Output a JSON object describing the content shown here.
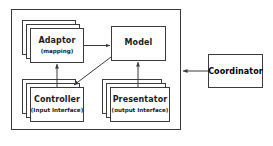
{
  "diagram": {
    "background_color": "#ffffff",
    "line_color": "#3b3b3b",
    "text_color": "#1a1a1a"
  },
  "container": {
    "name": "system-container",
    "label": ""
  },
  "nodes": [
    {
      "id": "adaptor",
      "title": "Adaptor",
      "subtitle": "(mapping)",
      "stacked": true,
      "stack_count": 3
    },
    {
      "id": "model",
      "title": "Model",
      "subtitle": "",
      "stacked": false,
      "stack_count": 1
    },
    {
      "id": "controller",
      "title": "Controller",
      "subtitle": "(Input Interface)",
      "stacked": true,
      "stack_count": 3
    },
    {
      "id": "presentator",
      "title": "Presentator",
      "subtitle": "(output Interface)",
      "stacked": true,
      "stack_count": 3
    },
    {
      "id": "coordinator",
      "title": "Coordinator",
      "subtitle": "",
      "stacked": false,
      "stack_count": 1
    }
  ],
  "connectors": [
    {
      "id": "adaptor-to-model",
      "from": "adaptor",
      "to": "model",
      "direction": "right",
      "arrowheads": 1
    },
    {
      "id": "controller-to-adaptor",
      "from": "controller",
      "to": "adaptor",
      "direction": "up",
      "arrowheads": 1
    },
    {
      "id": "model-to-controller",
      "from": "model",
      "to": "controller",
      "direction": "down-left",
      "arrowheads": 1
    },
    {
      "id": "presentator-to-model",
      "from": "presentator",
      "to": "model",
      "direction": "up",
      "arrowheads": 1
    },
    {
      "id": "coordinator-to-system",
      "from": "coordinator",
      "to": "container",
      "direction": "left",
      "arrowheads": 1
    }
  ]
}
